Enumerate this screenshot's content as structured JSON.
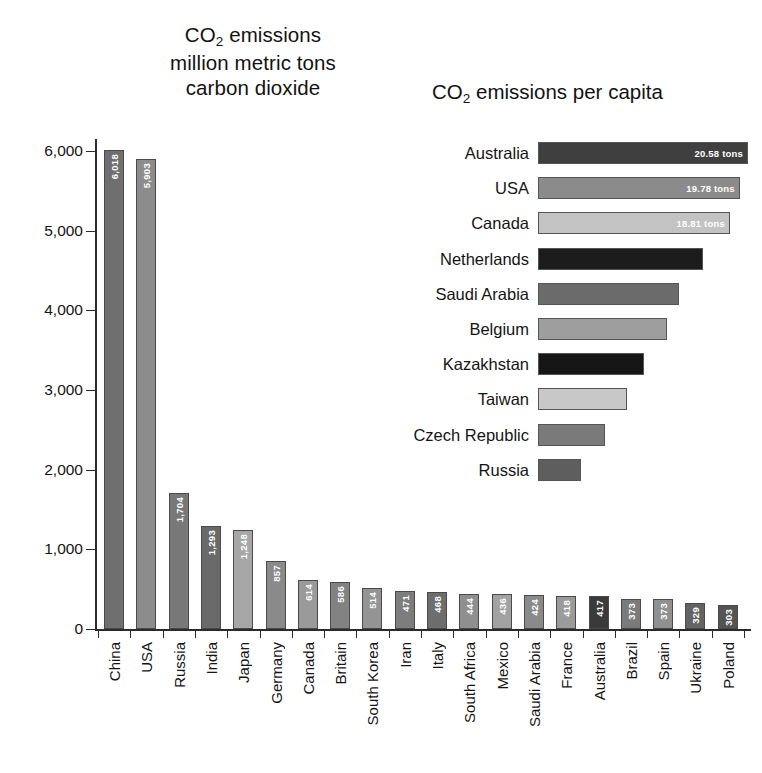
{
  "titles": {
    "left_line1_pre": "CO",
    "left_line1_sub": "2",
    "left_line1_post": " emissions",
    "left_line2": "million metric tons",
    "left_line3": "carbon dioxide",
    "right_pre": "CO",
    "right_sub": "2",
    "right_post": " emissions per capita"
  },
  "chart_data": [
    {
      "type": "bar",
      "id": "total-emissions",
      "title": "CO2 emissions million metric tons carbon dioxide",
      "xlabel": "",
      "ylabel": "",
      "ylim": [
        0,
        6400
      ],
      "grid": false,
      "legend": "none",
      "yticks": [
        0,
        1000,
        2000,
        3000,
        4000,
        5000,
        6000
      ],
      "ytick_labels": [
        "0",
        "1,000",
        "2,000",
        "3,000",
        "4,000",
        "5,000",
        "6,000"
      ],
      "categories": [
        "China",
        "USA",
        "Russia",
        "India",
        "Japan",
        "Germany",
        "Canada",
        "Britain",
        "South Korea",
        "Iran",
        "Italy",
        "South Africa",
        "Mexico",
        "Saudi Arabia",
        "France",
        "Australia",
        "Brazil",
        "Spain",
        "Ukraine",
        "Poland"
      ],
      "values": [
        6018,
        5903,
        1704,
        1293,
        1248,
        857,
        614,
        586,
        514,
        471,
        468,
        444,
        436,
        424,
        418,
        417,
        373,
        373,
        329,
        303
      ],
      "value_labels": [
        "6,018",
        "5,903",
        "1,704",
        "1,293",
        "1,248",
        "857",
        "614",
        "586",
        "514",
        "471",
        "468",
        "444",
        "436",
        "424",
        "418",
        "417",
        "373",
        "373",
        "329",
        "303"
      ],
      "bar_colors": [
        "#6f6f6f",
        "#8c8c8c",
        "#787878",
        "#696969",
        "#a7a7a7",
        "#8a8a8a",
        "#9a9a9a",
        "#828282",
        "#949494",
        "#7d7d7d",
        "#6d6d6d",
        "#8f8f8f",
        "#a2a2a2",
        "#8a8a8a",
        "#9b9b9b",
        "#3a3a3a",
        "#7b7b7b",
        "#909090",
        "#636363",
        "#545454"
      ],
      "label_visible": [
        true,
        true,
        true,
        true,
        true,
        true,
        true,
        true,
        true,
        true,
        true,
        true,
        true,
        true,
        true,
        true,
        true,
        true,
        true,
        true
      ]
    },
    {
      "type": "bar",
      "id": "per-capita-emissions",
      "orientation": "horizontal",
      "title": "CO2 emissions per capita",
      "xlabel": "",
      "ylabel": "",
      "unit": "tons",
      "grid": false,
      "legend": "none",
      "categories": [
        "Australia",
        "USA",
        "Canada",
        "Netherlands",
        "Saudi Arabia",
        "Belgium",
        "Kazakhstan",
        "Taiwan",
        "Czech Republic",
        "Russia"
      ],
      "values": [
        20.58,
        19.78,
        18.81,
        16.2,
        13.8,
        12.6,
        10.4,
        8.7,
        6.6,
        4.2
      ],
      "value_labels": [
        "20.58 tons",
        "19.78 tons",
        "18.81 tons",
        "",
        "",
        "",
        "",
        "",
        "",
        ""
      ],
      "bar_colors": [
        "#3f3f3f",
        "#8b8b8b",
        "#c3c3c3",
        "#1c1c1c",
        "#6b6b6b",
        "#9e9e9e",
        "#161616",
        "#c8c8c8",
        "#7a7a7a",
        "#5e5e5e"
      ]
    }
  ]
}
